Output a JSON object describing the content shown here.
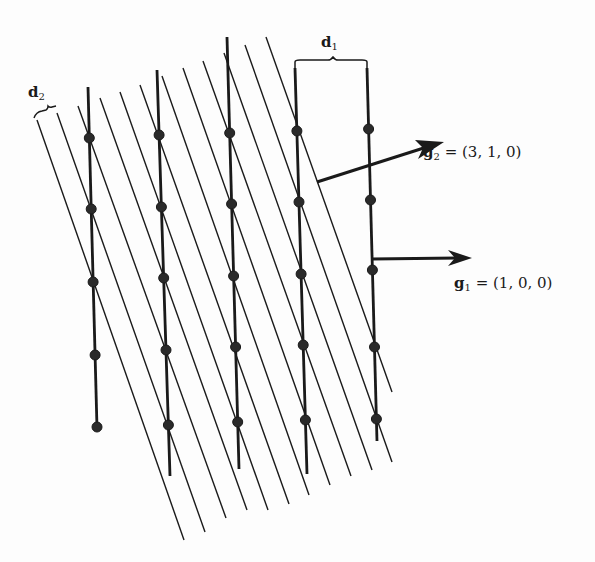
{
  "figure": {
    "background": "#fdfdfd",
    "ink_color": "#1a1a1a"
  },
  "labels": {
    "d1": {
      "main": "d",
      "sub": "1"
    },
    "d2": {
      "main": "d",
      "sub": "2"
    },
    "g1": {
      "main": "g",
      "sub": "1",
      "rhs": " = (1, 0, 0)"
    },
    "g2": {
      "main": "g",
      "sub": "2",
      "rhs": " = (3, 1, 0)"
    }
  },
  "vectors": [
    {
      "name": "g1",
      "components": [
        1,
        0,
        0
      ]
    },
    {
      "name": "g2",
      "components": [
        3,
        1,
        0
      ]
    }
  ],
  "lattice": {
    "vertical_planes": [
      {
        "top": [
          88,
          87
        ],
        "bottom": [
          97,
          428
        ],
        "dots_y": [
          138,
          209,
          282,
          355,
          427
        ]
      },
      {
        "top": [
          157,
          70
        ],
        "bottom": [
          170,
          476
        ],
        "dots_y": [
          135,
          207,
          278,
          350,
          425
        ]
      },
      {
        "top": [
          227,
          37
        ],
        "bottom": [
          239,
          469
        ],
        "dots_y": [
          133,
          204,
          276,
          347,
          422
        ]
      },
      {
        "top": [
          295,
          68
        ],
        "bottom": [
          307,
          474
        ],
        "dots_y": [
          131,
          202,
          274,
          345,
          420
        ]
      },
      {
        "top": [
          367,
          68
        ],
        "bottom": [
          377,
          441
        ],
        "dots_y": [
          129,
          200,
          270,
          347,
          419
        ]
      }
    ],
    "diagonal_planes": [
      {
        "top": [
          37,
          120
        ],
        "bottom": [
          184,
          540
        ]
      },
      {
        "top": [
          57,
          113
        ],
        "bottom": [
          205,
          532
        ]
      },
      {
        "top": [
          78,
          106
        ],
        "bottom": [
          226,
          518
        ]
      },
      {
        "top": [
          100,
          98
        ],
        "bottom": [
          247,
          510
        ]
      },
      {
        "top": [
          120,
          92
        ],
        "bottom": [
          268,
          510
        ]
      },
      {
        "top": [
          140,
          85
        ],
        "bottom": [
          289,
          504
        ]
      },
      {
        "top": [
          162,
          76
        ],
        "bottom": [
          309,
          495
        ]
      },
      {
        "top": [
          183,
          68
        ],
        "bottom": [
          330,
          485
        ]
      },
      {
        "top": [
          203,
          61
        ],
        "bottom": [
          351,
          476
        ]
      },
      {
        "top": [
          224,
          53
        ],
        "bottom": [
          372,
          470
        ]
      },
      {
        "top": [
          245,
          45
        ],
        "bottom": [
          392,
          462
        ]
      },
      {
        "top": [
          266,
          37
        ],
        "bottom": [
          392,
          392
        ]
      }
    ]
  }
}
